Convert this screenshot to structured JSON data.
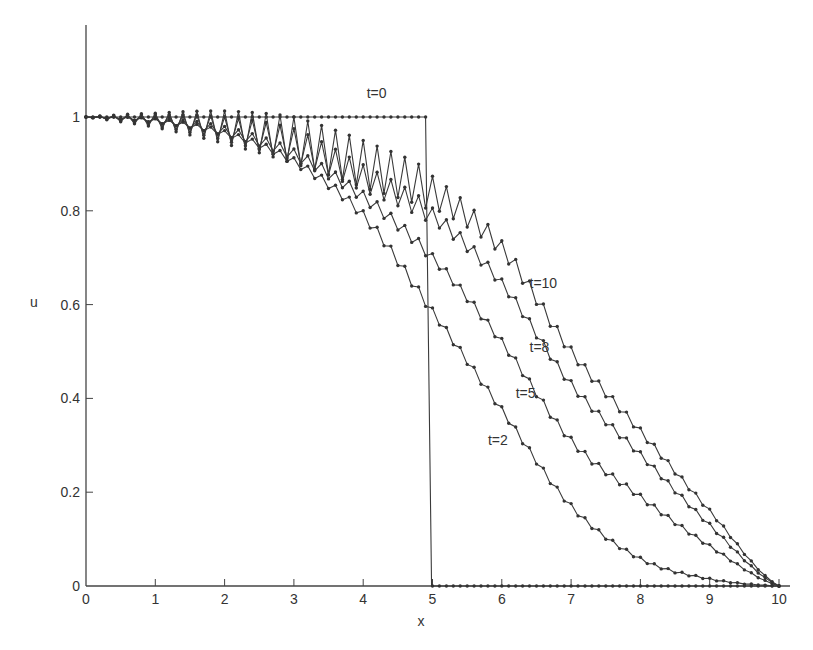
{
  "chart_data": {
    "type": "line",
    "title": "",
    "xlabel": "x",
    "ylabel": "u",
    "xlim": [
      0,
      10
    ],
    "ylim": [
      0,
      1.2
    ],
    "grid": false,
    "legend": "inline curve labels",
    "x_ticks": [
      0,
      1,
      2,
      3,
      4,
      5,
      6,
      7,
      8,
      9,
      10
    ],
    "x_tick_labels": [
      "0",
      "1",
      "2",
      "3",
      "4",
      "5",
      "6",
      "7",
      "8",
      "9",
      "10"
    ],
    "y_ticks": [
      0,
      0.2,
      0.4,
      0.6,
      0.8,
      1
    ],
    "y_tick_labels": [
      "0",
      "0.2",
      "0.4",
      "0.6",
      "0.8",
      "1"
    ],
    "grid_step": 0.1,
    "x_samples": [
      0,
      1,
      2,
      3,
      4,
      5,
      6,
      7,
      8,
      9,
      10
    ],
    "series": [
      {
        "name": "t=0",
        "label": "t=0",
        "type": "step",
        "step_at": 4.9,
        "values_at_samples": [
          1,
          1,
          1,
          1,
          1,
          0,
          0,
          0,
          0,
          0,
          0
        ],
        "oscillation_amplitude": [
          0,
          0,
          0,
          0,
          0,
          0,
          0,
          0,
          0,
          0,
          0
        ],
        "label_pos": [
          4.05,
          1.04
        ]
      },
      {
        "name": "t=2",
        "label": "t=2",
        "type": "line",
        "values_at_samples": [
          1,
          0.992,
          0.965,
          0.905,
          0.79,
          0.585,
          0.375,
          0.17,
          0.058,
          0.015,
          0
        ],
        "oscillation_amplitude": [
          0,
          0.004,
          0.006,
          0.008,
          0.01,
          0.01,
          0.009,
          0.007,
          0.004,
          0.002,
          0
        ],
        "label_pos": [
          5.8,
          0.3
        ]
      },
      {
        "name": "t=5",
        "label": "t=5",
        "type": "line",
        "values_at_samples": [
          1,
          0.993,
          0.97,
          0.92,
          0.83,
          0.7,
          0.52,
          0.31,
          0.19,
          0.085,
          0
        ],
        "oscillation_amplitude": [
          0,
          0.006,
          0.01,
          0.012,
          0.012,
          0.011,
          0.01,
          0.009,
          0.007,
          0.004,
          0
        ],
        "label_pos": [
          6.2,
          0.4
        ]
      },
      {
        "name": "t=8",
        "label": "t=8",
        "type": "line",
        "values_at_samples": [
          1,
          0.993,
          0.975,
          0.94,
          0.87,
          0.79,
          0.645,
          0.43,
          0.28,
          0.13,
          0
        ],
        "oscillation_amplitude": [
          0,
          0.012,
          0.025,
          0.035,
          0.028,
          0.02,
          0.012,
          0.01,
          0.008,
          0.005,
          0
        ],
        "label_pos": [
          6.4,
          0.5
        ]
      },
      {
        "name": "t=10",
        "label": "t=10",
        "type": "line",
        "values_at_samples": [
          1,
          0.993,
          0.978,
          0.95,
          0.9,
          0.84,
          0.72,
          0.5,
          0.33,
          0.16,
          0
        ],
        "oscillation_amplitude": [
          0,
          0.015,
          0.035,
          0.05,
          0.05,
          0.042,
          0.02,
          0.012,
          0.009,
          0.005,
          0
        ],
        "label_pos": [
          6.4,
          0.635
        ]
      }
    ]
  }
}
